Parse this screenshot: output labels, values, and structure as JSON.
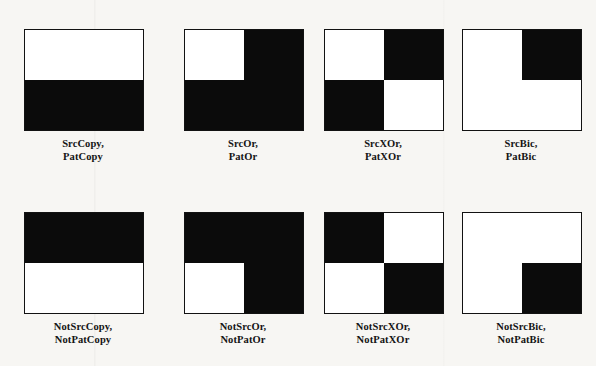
{
  "figure": {
    "colors": {
      "background": "#f7f6f3",
      "ink": "#0b0b0b",
      "paper": "#ffffff",
      "border": "#121212"
    },
    "rows": [
      {
        "name": "source-modes-row",
        "cells": [
          {
            "name": "srccopy",
            "quadrants": [
              "white",
              "white",
              "black",
              "black"
            ],
            "label_line1": "SrcCopy,",
            "label_line2": "PatCopy"
          },
          {
            "name": "srcor",
            "quadrants": [
              "white",
              "black",
              "black",
              "black"
            ],
            "label_line1": "SrcOr,",
            "label_line2": "PatOr"
          },
          {
            "name": "srcxor",
            "quadrants": [
              "white",
              "black",
              "black",
              "white"
            ],
            "label_line1": "SrcXOr,",
            "label_line2": "PatXOr"
          },
          {
            "name": "srcbic",
            "quadrants": [
              "white",
              "black",
              "white",
              "white"
            ],
            "label_line1": "SrcBic,",
            "label_line2": "PatBic"
          }
        ]
      },
      {
        "name": "not-source-modes-row",
        "cells": [
          {
            "name": "notsrccopy",
            "quadrants": [
              "black",
              "black",
              "white",
              "white"
            ],
            "label_line1": "NotSrcCopy,",
            "label_line2": "NotPatCopy"
          },
          {
            "name": "notsrcor",
            "quadrants": [
              "black",
              "black",
              "white",
              "black"
            ],
            "label_line1": "NotSrcOr,",
            "label_line2": "NotPatOr"
          },
          {
            "name": "notsrcxor",
            "quadrants": [
              "black",
              "white",
              "white",
              "black"
            ],
            "label_line1": "NotSrcXOr,",
            "label_line2": "NotPatXOr"
          },
          {
            "name": "notsrcbic",
            "quadrants": [
              "white",
              "white",
              "white",
              "black"
            ],
            "label_line1": "NotSrcBic,",
            "label_line2": "NotPatBic"
          }
        ]
      }
    ]
  }
}
